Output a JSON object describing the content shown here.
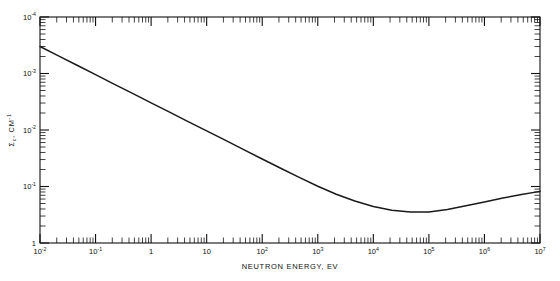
{
  "figure": {
    "background": "#ffffff",
    "line_color": "#1a1a1a",
    "axis_color": "#111111"
  },
  "axes": {
    "x_title": "NEUTRON ENERGY, EV",
    "y_title_main": "Σ",
    "y_title_sub": "c",
    "y_title_rest": ", CM",
    "y_title_exp": "-1",
    "x_tick_labels": [
      "10",
      "10",
      "1",
      "10",
      "10",
      "10",
      "10",
      "10",
      "10",
      "10"
    ],
    "x_tick_exponents": [
      "-2",
      "-1",
      "",
      "",
      "2",
      "3",
      "4",
      "5",
      "6",
      "7"
    ],
    "y_tick_labels": [
      "1",
      "10",
      "10",
      "10",
      "10"
    ],
    "y_tick_exponents": [
      "",
      "-1",
      "-2",
      "-3",
      "-4"
    ]
  },
  "chart_data": {
    "type": "line",
    "title": "",
    "subtitle": "",
    "xlabel": "NEUTRON ENERGY, EV",
    "ylabel": "Σc, CM-1",
    "xscale": "log",
    "yscale": "log",
    "xlim": [
      0.01,
      10000000
    ],
    "ylim": [
      0.0001,
      1
    ],
    "grid": false,
    "legend": "none",
    "x_major_ticks": [
      0.01,
      0.1,
      1,
      10,
      100,
      1000,
      10000,
      100000,
      1000000,
      10000000
    ],
    "x_major_tick_text": [
      "10^-2",
      "10^-1",
      "1",
      "10",
      "10^2",
      "10^3",
      "10^4",
      "10^5",
      "10^6",
      "10^7"
    ],
    "y_major_ticks": [
      0.0001,
      0.001,
      0.01,
      0.1,
      1
    ],
    "y_major_tick_text": [
      "10^-4",
      "10^-3",
      "10^-2",
      "10^-1",
      "1"
    ],
    "series": [
      {
        "name": "macroscopic capture cross section",
        "x": [
          0.01,
          0.0215,
          0.0464,
          0.1,
          0.215,
          0.464,
          1,
          2.15,
          4.64,
          10,
          21.5,
          46.4,
          100,
          215,
          464,
          1000,
          2150,
          4640,
          10000,
          21500,
          46400,
          100000,
          215000,
          464000,
          1000000,
          2150000,
          4640000,
          10000000
        ],
        "y": [
          0.3,
          0.205,
          0.14,
          0.0955,
          0.065,
          0.0445,
          0.0303,
          0.0207,
          0.0141,
          0.00965,
          0.0066,
          0.0045,
          0.00307,
          0.0021,
          0.00145,
          0.00101,
          0.00073,
          0.000553,
          0.000442,
          0.00038,
          0.000352,
          0.000355,
          0.00039,
          0.000455,
          0.00053,
          0.000625,
          0.00072,
          0.00082
        ]
      }
    ],
    "annotations": [
      {
        "text": "1/v region, slope -1/2 on log-log",
        "x_range": [
          0.01,
          1000
        ]
      },
      {
        "text": "broad minimum",
        "x": 60000,
        "y": 0.00035
      }
    ]
  }
}
